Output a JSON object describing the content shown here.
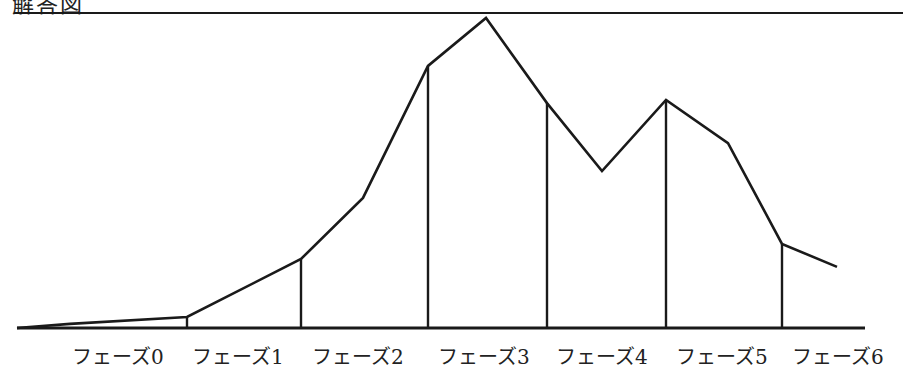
{
  "chart_data": {
    "type": "line",
    "title": "解答図",
    "xlabel": "",
    "ylabel": "",
    "grid": false,
    "legend": "none",
    "categories": [
      "フェーズ0",
      "フェーズ1",
      "フェーズ2",
      "フェーズ3",
      "フェーズ4",
      "フェーズ5",
      "フェーズ6"
    ],
    "ylim": [
      0,
      100
    ],
    "series": [
      {
        "name": "curve",
        "points": [
          {
            "x": 17,
            "value": 0
          },
          {
            "x": 70,
            "value": 1.3
          },
          {
            "x": 187,
            "value": 3.5
          },
          {
            "x": 301,
            "value": 21.9
          },
          {
            "x": 363,
            "value": 41.3
          },
          {
            "x": 428,
            "value": 83.2
          },
          {
            "x": 486,
            "value": 98.4
          },
          {
            "x": 547,
            "value": 71.4
          },
          {
            "x": 602,
            "value": 49.8
          },
          {
            "x": 666,
            "value": 72.4
          },
          {
            "x": 728,
            "value": 58.7
          },
          {
            "x": 782,
            "value": 26.7
          },
          {
            "x": 837,
            "value": 19.4
          }
        ]
      }
    ],
    "phase_boundaries": [
      {
        "x": 187,
        "value": 3.5
      },
      {
        "x": 301,
        "value": 21.9
      },
      {
        "x": 428,
        "value": 83.2
      },
      {
        "x": 547,
        "value": 71.4
      },
      {
        "x": 666,
        "value": 72.4
      },
      {
        "x": 782,
        "value": 26.7
      }
    ],
    "layout": {
      "baseline_y": 328,
      "top_line_y": 13,
      "x_start": 17,
      "x_end": 865,
      "top_line_x_start": 14,
      "top_line_x_end": 903
    }
  },
  "labels": [
    {
      "text": "フェーズ0",
      "x": 72
    },
    {
      "text": "フェーズ1",
      "x": 192
    },
    {
      "text": "フェーズ2",
      "x": 312
    },
    {
      "text": "フェーズ3",
      "x": 438
    },
    {
      "text": "フェーズ4",
      "x": 556
    },
    {
      "text": "フェーズ5",
      "x": 676
    },
    {
      "text": "フェーズ6",
      "x": 792
    }
  ],
  "colors": {
    "line": "#1a1a1a",
    "background": "#ffffff"
  }
}
